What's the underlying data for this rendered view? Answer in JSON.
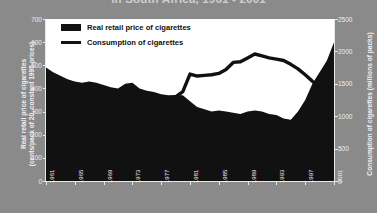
{
  "title": "in South Africa, 1961 - 2001",
  "colors": {
    "background": "#8a8a8a",
    "plot_background": "#ffffff",
    "series_price_fill": "#111111",
    "series_consumption_line": "#111111",
    "axis_text": "#f0f0f0"
  },
  "legend": {
    "items": [
      {
        "label": "Real retail price of cigarettes",
        "marker": "filled-area-swatch"
      },
      {
        "label": "Consumption of cigarettes",
        "marker": "line-swatch"
      }
    ]
  },
  "axes": {
    "left": {
      "title_line1": "Real retail price of cigarettes",
      "title_line2": "(cents/pack of 20, constant 1995 prices)",
      "ticks": [
        "0",
        "100",
        "200",
        "300",
        "400",
        "500",
        "600",
        "700"
      ],
      "min": 0,
      "max": 700
    },
    "right": {
      "title": "Consumption of cigarettes (millions of packs)",
      "ticks": [
        "0",
        "500",
        "1000",
        "1500",
        "2000",
        "2500"
      ],
      "min": 0,
      "max": 2500
    },
    "bottom": {
      "ticks": [
        "1961",
        "1965",
        "1969",
        "1973",
        "1977",
        "1981",
        "1985",
        "1989",
        "1993",
        "1997",
        "2001"
      ]
    }
  },
  "chart_data": {
    "type": "line",
    "title": "in South Africa, 1961 - 2001",
    "xlabel": "",
    "ylabel": "Real retail price of cigarettes (cents/pack of 20, constant 1995 prices)",
    "y2label": "Consumption of cigarettes (millions of packs)",
    "xlim": [
      1961,
      2001
    ],
    "ylim": [
      0,
      700
    ],
    "y2lim": [
      0,
      2500
    ],
    "grid": false,
    "legend_position": "top-left",
    "x": [
      1961,
      1962,
      1963,
      1964,
      1965,
      1966,
      1967,
      1968,
      1969,
      1970,
      1971,
      1972,
      1973,
      1974,
      1975,
      1976,
      1977,
      1978,
      1979,
      1980,
      1981,
      1982,
      1983,
      1984,
      1985,
      1986,
      1987,
      1988,
      1989,
      1990,
      1991,
      1992,
      1993,
      1994,
      1995,
      1996,
      1997,
      1998,
      1999,
      2000,
      2001
    ],
    "series": [
      {
        "name": "Real retail price of cigarettes",
        "axis": "left",
        "render": "area",
        "units": "cents per pack of 20, constant 1995 prices",
        "values": [
          490,
          470,
          455,
          440,
          430,
          425,
          430,
          425,
          415,
          405,
          400,
          420,
          425,
          400,
          390,
          385,
          375,
          370,
          372,
          370,
          345,
          320,
          310,
          300,
          305,
          300,
          295,
          290,
          300,
          305,
          300,
          290,
          285,
          270,
          265,
          300,
          350,
          420,
          470,
          520,
          600
        ]
      },
      {
        "name": "Consumption of cigarettes",
        "axis": "right",
        "render": "line",
        "units": "millions of packs",
        "values": [
          740,
          760,
          790,
          800,
          820,
          850,
          870,
          900,
          930,
          960,
          1000,
          1010,
          1060,
          1090,
          1110,
          1130,
          1180,
          1240,
          1300,
          1380,
          1650,
          1620,
          1630,
          1640,
          1660,
          1720,
          1830,
          1840,
          1900,
          1960,
          1930,
          1900,
          1880,
          1860,
          1800,
          1730,
          1640,
          1540,
          1450,
          1400,
          1380
        ]
      }
    ]
  }
}
